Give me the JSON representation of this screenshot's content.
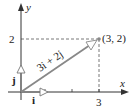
{
  "diagram": {
    "title": "",
    "axes": {
      "x_label": "x",
      "y_label": "y"
    },
    "ticks": {
      "x_label_3": "3",
      "y_label_2": "2"
    },
    "point": {
      "label": "(3, 2)",
      "x": 3,
      "y": 2
    },
    "vectors": [
      {
        "name": "i",
        "label": "i",
        "from": [
          0,
          0
        ],
        "to": [
          1,
          0
        ]
      },
      {
        "name": "j",
        "label": "j",
        "from": [
          0,
          0
        ],
        "to": [
          0,
          1
        ]
      },
      {
        "name": "3i+2j",
        "label": "3i + 2j",
        "from": [
          0,
          0
        ],
        "to": [
          3,
          2
        ]
      }
    ],
    "colors": {
      "axis": "#333333",
      "vector": "#777777",
      "dashed": "#555555",
      "point": "#888888"
    }
  }
}
